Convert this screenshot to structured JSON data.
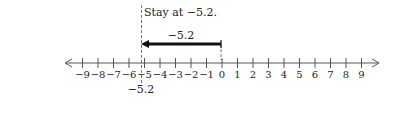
{
  "diagram": {
    "type": "number-line",
    "range": {
      "min": -9,
      "max": 9,
      "step": 1
    },
    "tick_labels": [
      "−9",
      "−8",
      "−7",
      "−6",
      "−5",
      "−4",
      "−3",
      "−2",
      "−1",
      "0",
      "1",
      "2",
      "3",
      "4",
      "5",
      "6",
      "7",
      "8",
      "9"
    ],
    "caption": "Stay at −5.2.",
    "movement": {
      "from": 0,
      "to": -5.2,
      "label": "−5.2",
      "direction": "left"
    },
    "marker": {
      "value": -5.2,
      "label": "−5.2"
    },
    "colors": {
      "axis": "#555555",
      "arrow": "#111111",
      "dashed": "#777777",
      "text": "#222222"
    }
  }
}
